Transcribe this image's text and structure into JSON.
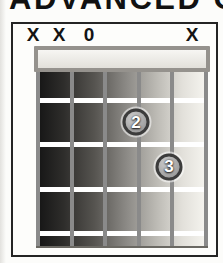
{
  "heading": {
    "text": "ADVANCED C"
  },
  "chord_box": {
    "markers": [
      {
        "string": 1,
        "label": "X"
      },
      {
        "string": 2,
        "label": "X"
      },
      {
        "string": 3,
        "label": "0"
      },
      {
        "string": 6,
        "label": "X"
      }
    ],
    "fingers": [
      {
        "string": 4,
        "fret": 2,
        "label": "2"
      },
      {
        "string": 5,
        "fret": 3,
        "label": "3"
      }
    ],
    "strings": 6,
    "fret_lines": 4,
    "colors": {
      "heading_text": "#111111",
      "box_border": "#242424",
      "marker_text": "#141414",
      "nut_border": "#95928d",
      "nut_fill_top": "#f7f6f3",
      "nut_fill_bottom": "#e2e0da",
      "board_dark": "#141414",
      "board_light": "#f7f6f1",
      "string_line": "#8a8a8a",
      "fret_line": "#ffffff",
      "finger_ring": "#3c3c3c",
      "finger_fill_light": "#cccccc",
      "finger_fill_dark": "#8e8e8e",
      "finger_text": "#ffffff"
    }
  }
}
